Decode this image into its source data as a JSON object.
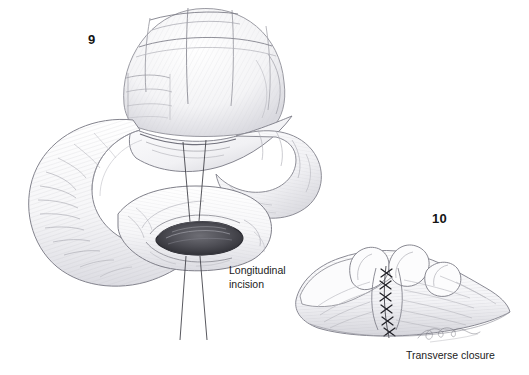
{
  "page": {
    "background_color": "#ffffff",
    "width": 529,
    "height": 375,
    "medium": "graphite pencil medical illustration"
  },
  "figures": [
    {
      "number": "9",
      "name": "longitudinal-incision-figure",
      "caption": "Longitudinal\nincision",
      "description": "Bowel loops with a longitudinal incision opened into a lens-shaped defect, marked by converging leader lines",
      "leader_lines": 4,
      "incision_shape": "lens"
    },
    {
      "number": "10",
      "name": "transverse-closure-figure",
      "caption": "Transverse closure",
      "description": "The same defect closed transversely with a vertical row of interrupted sutures",
      "suture_count": 6,
      "suture_glyph": "x"
    }
  ],
  "signature": {
    "text": "Jan Redden",
    "style": "cursive artist signature",
    "visible": true
  },
  "colors": {
    "ink_dark": "#1b1b1b",
    "ink_mid": "#6d6d72",
    "ink_light": "#b9b9bf",
    "ink_faint": "#d8d8dd",
    "incision_fill": "#4a4a50",
    "background": "#ffffff"
  }
}
